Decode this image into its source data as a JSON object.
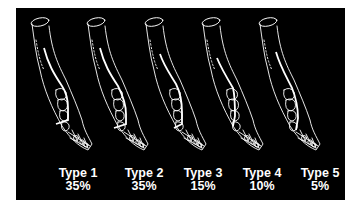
{
  "figure": {
    "background": "#000000",
    "line_color": "#ffffff",
    "types": [
      {
        "name": "Type 1",
        "percent": "35%",
        "x": 32,
        "label_cx": 78
      },
      {
        "name": "Type 2",
        "percent": "35%",
        "x": 88,
        "label_cx": 144
      },
      {
        "name": "Type 3",
        "percent": "15%",
        "x": 146,
        "label_cx": 203
      },
      {
        "name": "Type 4",
        "percent": "10%",
        "x": 203,
        "label_cx": 262
      },
      {
        "name": "Type 5",
        "percent": "5%",
        "x": 260,
        "label_cx": 320
      }
    ]
  }
}
